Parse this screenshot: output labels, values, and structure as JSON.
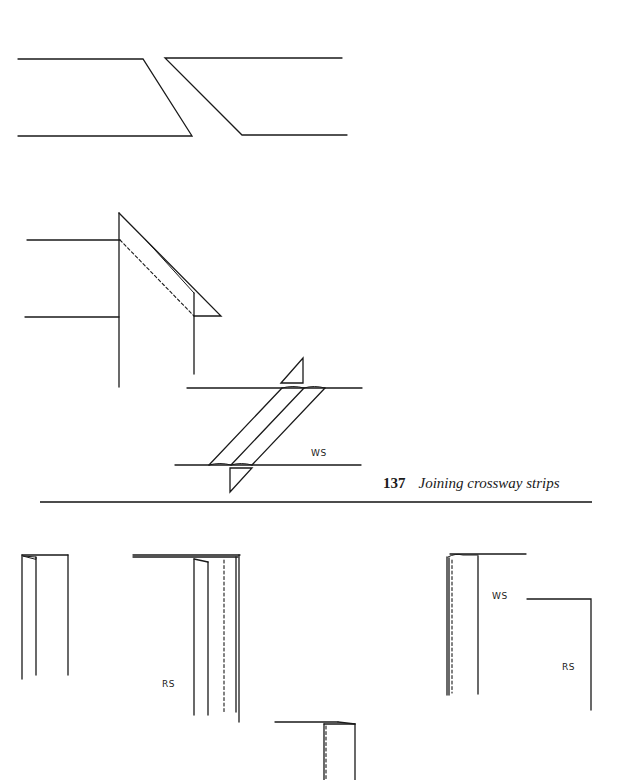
{
  "figure": {
    "number": "137",
    "caption": "Joining crossway strips"
  },
  "labels": {
    "joining_ws": "WS",
    "bottom_left_rs": "RS",
    "bottom_right_ws": "WS",
    "bottom_right_rs": "RS"
  },
  "colors": {
    "ink": "#1a1a1a",
    "background": "#ffffff"
  }
}
